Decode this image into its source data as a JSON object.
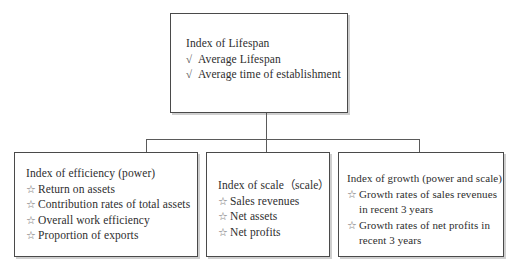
{
  "diagram": {
    "bullets": {
      "check": "√",
      "star": "☆"
    },
    "colors": {
      "box_border": "#4a4a4a",
      "box_shadow": "#cfcfcf",
      "connector": "#5a5a5a",
      "text": "#2e2e2e",
      "background": "#ffffff"
    },
    "nodes": {
      "root": {
        "heading": "Index of Lifespan",
        "items": [
          "Average Lifespan",
          "Average time of establishment"
        ]
      },
      "efficiency": {
        "heading": "Index of efficiency (power)",
        "items": [
          "Return on assets",
          "Contribution rates of total assets",
          "Overall work efficiency",
          "Proportion of exports"
        ]
      },
      "scale": {
        "heading": "Index of scale（scale）",
        "items": [
          "Sales revenues",
          "Net assets",
          "Net profits"
        ]
      },
      "growth": {
        "heading": "Index of growth (power and scale)",
        "items": [
          {
            "first": "Growth rates of sales revenues",
            "second": "in recent 3 years"
          },
          {
            "first": "Growth rates of net profits in",
            "second": "recent 3 years"
          }
        ]
      }
    }
  }
}
